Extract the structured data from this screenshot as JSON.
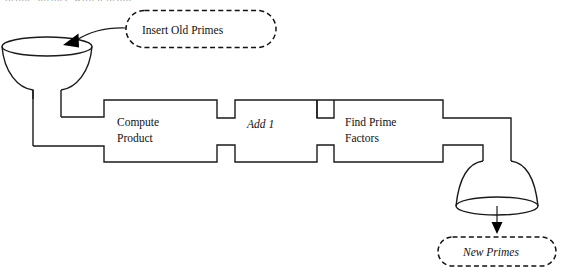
{
  "figure": {
    "title_fragment_cut_off_at_top": "prime surface with a prime",
    "background_color": "#ffffff",
    "line_color": "#1a1a1a"
  },
  "callouts": [
    {
      "name": "insert-old-primes",
      "label": "Insert Old Primes",
      "style": "dashed-rounded",
      "italic": false
    },
    {
      "name": "new-primes",
      "label": "New Primes",
      "style": "dashed-rounded",
      "italic": true
    }
  ],
  "pipeline": {
    "stages": [
      {
        "name": "compute-product",
        "label_line1": "Compute",
        "label_line2": "Product",
        "italic": false
      },
      {
        "name": "add-one",
        "label_line1": "Add 1",
        "label_line2": "",
        "italic": true
      },
      {
        "name": "find-prime-factors",
        "label_line1": "Find Prime",
        "label_line2": "Factors",
        "italic": false
      }
    ]
  },
  "vessels": [
    {
      "name": "input-funnel",
      "role": "input",
      "description": "funnel"
    },
    {
      "name": "output-funnel",
      "role": "output",
      "description": "inverted funnel"
    }
  ],
  "arrows": [
    {
      "name": "insert-arrow",
      "from": "insert-old-primes",
      "to": "input-funnel"
    },
    {
      "name": "output-arrow",
      "from": "output-funnel",
      "to": "new-primes"
    }
  ]
}
